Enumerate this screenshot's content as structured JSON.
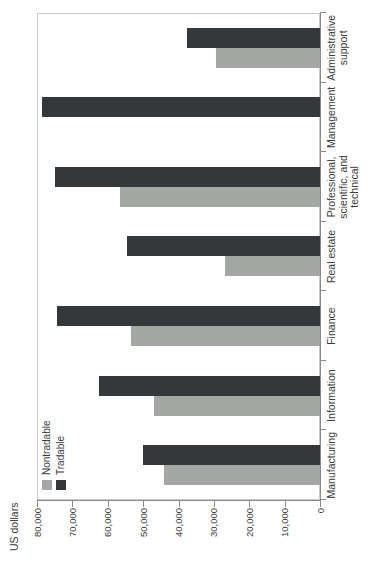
{
  "colors": {
    "nontradable": "#a4a7a3",
    "tradable": "#34383b",
    "axis_line": "#8a8a8a",
    "plot_border": "#c9c9c9",
    "text": "#3b3b3b",
    "background": "#ffffff"
  },
  "chart_data": {
    "type": "bar",
    "title": "",
    "ylabel": "US dollars",
    "xlabel": "",
    "ylim": [
      0,
      80000
    ],
    "ytick_step": 10000,
    "ytick_labels": [
      "0",
      "10,000",
      "20,000",
      "30,000",
      "40,000",
      "50,000",
      "60,000",
      "70,000",
      "80,000"
    ],
    "grid": false,
    "legend_position": "top-left",
    "legend_entries": [
      "Nontradable",
      "Tradable"
    ],
    "layout_note": "vertical grouped bar chart rendered landscape, rotated 90 degrees counterclockwise in the screenshot",
    "categories": [
      "Manufacturing",
      "Information",
      "Finance",
      "Real estate",
      "Professional, scientific, and technical",
      "Management",
      "Administrative support"
    ],
    "category_label_lines": [
      [
        "Manufacturing"
      ],
      [
        "Information"
      ],
      [
        "Finance"
      ],
      [
        "Real estate"
      ],
      [
        "Professional,",
        "scientific, and",
        "technical"
      ],
      [
        "Management"
      ],
      [
        "Administrative",
        "support"
      ]
    ],
    "series": [
      {
        "name": "Nontradable",
        "color": "#a4a7a3",
        "values": [
          44000,
          47000,
          53500,
          27000,
          56500,
          null,
          29500
        ]
      },
      {
        "name": "Tradable",
        "color": "#34383b",
        "values": [
          50000,
          62500,
          74500,
          54500,
          75000,
          78500,
          37500
        ]
      }
    ]
  }
}
